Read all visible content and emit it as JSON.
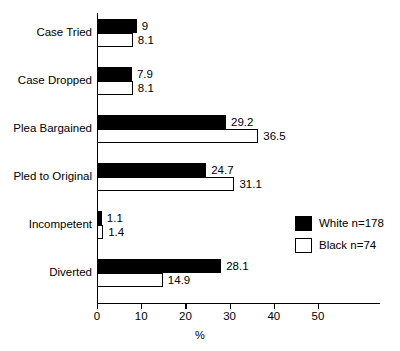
{
  "chart_data": {
    "type": "bar",
    "orientation": "horizontal",
    "title": "",
    "subtitle": "",
    "xlabel": "%",
    "ylabel": "",
    "xlim": [
      0,
      57
    ],
    "xticks": [
      0,
      10,
      20,
      30,
      40,
      50
    ],
    "xtick_labels": [
      "0",
      "10",
      "20",
      "30",
      "40",
      "50"
    ],
    "grid": false,
    "legend_position": "center-right",
    "categories": [
      "Case Tried",
      "Case Dropped",
      "Plea Bargained",
      "Pled to Original",
      "Incompetent",
      "Diverted"
    ],
    "series": [
      {
        "name": "White n=178",
        "style": "filled",
        "color": "#000000",
        "values": [
          9,
          7.9,
          29.2,
          24.7,
          1.1,
          28.1
        ],
        "value_labels": [
          "9",
          "7.9",
          "29.2",
          "24.7",
          "1.1",
          "28.1"
        ]
      },
      {
        "name": "Black n=74",
        "style": "hollow",
        "color": "#ffffff",
        "values": [
          8.1,
          8.1,
          36.5,
          31.1,
          1.4,
          14.9
        ],
        "value_labels": [
          "8.1",
          "8.1",
          "36.5",
          "31.1",
          "1.4",
          "14.9"
        ]
      }
    ]
  },
  "legend": {
    "items": [
      {
        "label": "White n=178",
        "style": "filled"
      },
      {
        "label": "Black n=74",
        "style": "hollow"
      }
    ]
  },
  "axis": {
    "x_title": "%"
  }
}
